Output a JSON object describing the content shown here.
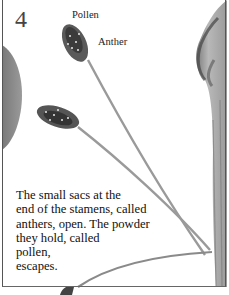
{
  "illustration": {
    "step_number": "4",
    "labels": {
      "pollen": "Pollen",
      "anther": "Anther"
    },
    "caption_lines": [
      "The small sacs at the",
      "end of the stamens, called",
      "anthers, open. The powder",
      "they hold, called",
      "pollen,",
      "escapes."
    ],
    "subjects": [
      "flower-petal-left",
      "anther-upper",
      "anther-middle",
      "stamen-filaments",
      "flower-petal-right"
    ]
  }
}
